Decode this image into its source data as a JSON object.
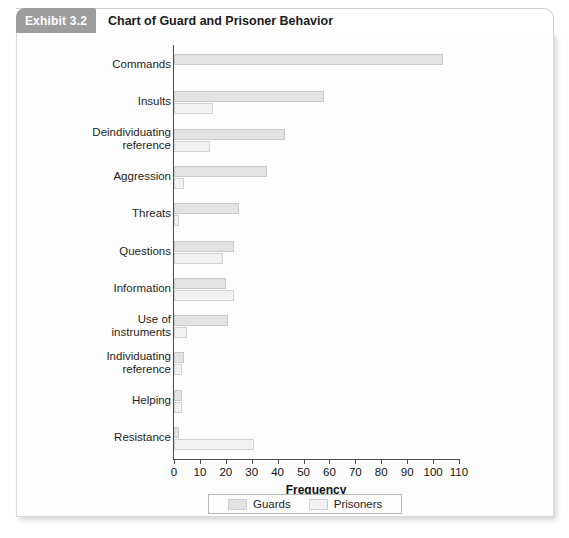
{
  "header": {
    "exhibit_tag": "Exhibit 3.2",
    "title": "Chart of Guard and Prisoner Behavior"
  },
  "legend": {
    "guards_label": "Guards",
    "prisoners_label": "Prisoners"
  },
  "colors": {
    "guards_bar": "#e3e3e3",
    "prisoners_bar": "#f1f1f1",
    "tab_background": "#9d9d9d",
    "axis": "#4a4a4a",
    "panel_background": "#fdfdfd"
  },
  "chart_data": {
    "type": "bar",
    "orientation": "horizontal",
    "title": "Chart of Guard and Prisoner Behavior",
    "xlabel": "Frequency",
    "ylabel": "",
    "xlim": [
      0,
      110
    ],
    "xticks": [
      0,
      10,
      20,
      30,
      40,
      50,
      60,
      70,
      80,
      90,
      100,
      110
    ],
    "grid": false,
    "legend_position": "bottom",
    "categories": [
      "Commands",
      "Insults",
      "Deindividuating\nreference",
      "Aggression",
      "Threats",
      "Questions",
      "Information",
      "Use of\ninstruments",
      "Individuating\nreference",
      "Helping",
      "Resistance"
    ],
    "series": [
      {
        "name": "Guards",
        "values": [
          104,
          58,
          43,
          36,
          25,
          23,
          20,
          21,
          4,
          3,
          2
        ]
      },
      {
        "name": "Prisoners",
        "values": [
          0,
          15,
          14,
          4,
          2,
          19,
          23,
          5,
          3,
          3,
          31
        ]
      }
    ]
  }
}
